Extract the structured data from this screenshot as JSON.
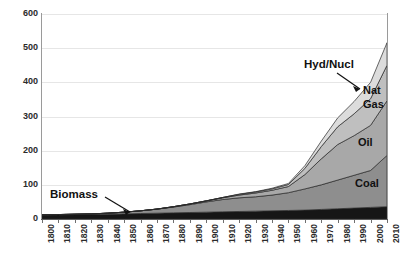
{
  "chart_data": {
    "type": "area",
    "title": "",
    "subtitle": "",
    "xlabel": "",
    "ylabel": "",
    "stacked": true,
    "grid": true,
    "legend_position": "inline-labels",
    "xlim": [
      1800,
      2010
    ],
    "ylim": [
      0,
      600
    ],
    "ytick_values": [
      600,
      500,
      400,
      300,
      200,
      100,
      0
    ],
    "ytick_labels": [
      "600",
      "500",
      "400",
      "300",
      "200",
      "100",
      "0"
    ],
    "x": [
      1800,
      1810,
      1820,
      1830,
      1840,
      1850,
      1860,
      1870,
      1880,
      1890,
      1900,
      1910,
      1920,
      1930,
      1940,
      1950,
      1960,
      1970,
      1980,
      1990,
      2000,
      2010
    ],
    "xtick_labels": [
      "1800",
      "1810",
      "1820",
      "1830",
      "1840",
      "1850",
      "1860",
      "1870",
      "1880",
      "1890",
      "1900",
      "1910",
      "1920",
      "1930",
      "1940",
      "1950",
      "1960",
      "1970",
      "1980",
      "1990",
      "2000",
      "2010"
    ],
    "series": [
      {
        "name": "Biomass",
        "label": "Biomass",
        "color": "#161616",
        "values": [
          12,
          12,
          13,
          13,
          14,
          15,
          16,
          17,
          18,
          19,
          20,
          21,
          22,
          23,
          24,
          25,
          26,
          28,
          30,
          32,
          34,
          36
        ]
      },
      {
        "name": "Coal",
        "label": "Coal",
        "color": "#8e8e8e",
        "values": [
          0,
          1,
          1,
          2,
          3,
          5,
          8,
          12,
          17,
          23,
          30,
          36,
          40,
          42,
          46,
          52,
          62,
          72,
          84,
          96,
          108,
          150
        ]
      },
      {
        "name": "Oil",
        "label": "Oil",
        "color": "#a8a8a8",
        "values": [
          0,
          0,
          0,
          0,
          0,
          0,
          0,
          0,
          1,
          2,
          3,
          5,
          8,
          11,
          14,
          18,
          42,
          76,
          104,
          116,
          132,
          160
        ]
      },
      {
        "name": "Nat Gas",
        "label": "Nat Gas",
        "color": "#bfbfbf",
        "values": [
          0,
          0,
          0,
          0,
          0,
          0,
          0,
          0,
          0,
          0,
          0,
          1,
          2,
          3,
          4,
          6,
          18,
          36,
          52,
          64,
          78,
          104
        ]
      },
      {
        "name": "Hyd/Nucl",
        "label": "Hyd/Nucl",
        "color": "#dcdcdc",
        "values": [
          0,
          0,
          0,
          0,
          0,
          0,
          0,
          0,
          0,
          0,
          0,
          0,
          1,
          1,
          2,
          3,
          8,
          16,
          26,
          36,
          48,
          66
        ]
      }
    ],
    "annotations": [
      {
        "text": "Biomass",
        "target_x": 1848,
        "target_y": 16
      },
      {
        "text": "Hyd/Nucl",
        "target_x": 1986,
        "target_y": 372
      }
    ]
  },
  "inline_labels": {
    "coal": "Coal",
    "oil": "Oil",
    "nat_gas_line1": "Nat",
    "nat_gas_line2": "Gas"
  },
  "annotations": {
    "biomass": "Biomass",
    "hyd_nucl": "Hyd/Nucl"
  },
  "colors": {
    "biomass": "#161616",
    "coal": "#8e8e8e",
    "oil": "#a8a8a8",
    "nat_gas": "#bfbfbf",
    "hyd_nucl": "#dcdcdc",
    "gridline": "#e6e6e6",
    "axis": "#5a5a5a",
    "text": "#1a1a1a",
    "background": "#ffffff"
  }
}
